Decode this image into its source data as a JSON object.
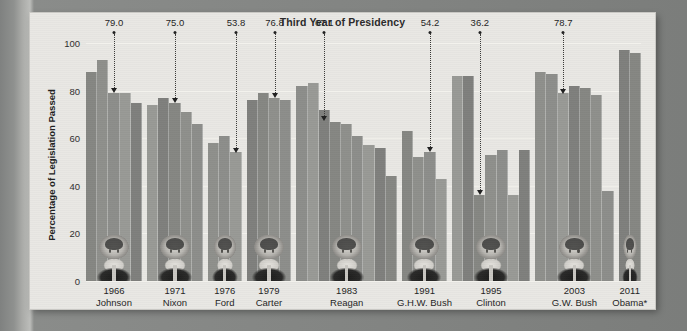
{
  "chart_title": "Third Year of Presidency",
  "y_axis_label": "Percentage of Legislation Passed",
  "y_ticks": [
    "0",
    "20",
    "40",
    "60",
    "80",
    "100"
  ],
  "watermark": "photocopy edge artifact",
  "chart_data": {
    "type": "bar",
    "title": "Third Year of Presidency",
    "xlabel": "",
    "ylabel": "Percentage of Legislation Passed",
    "ylim": [
      0,
      100
    ],
    "yticks": [
      0,
      20,
      40,
      60,
      80,
      100
    ],
    "grid": true,
    "legend": "none",
    "annotation_note": "Dotted callouts mark each president's third year in office",
    "groups": [
      {
        "president": "Johnson",
        "third_year": "1966",
        "third_year_value": 79.0,
        "callout_label": "79.0",
        "values": [
          88,
          93,
          79,
          79,
          75
        ]
      },
      {
        "president": "Nixon",
        "third_year": "1971",
        "third_year_value": 75.0,
        "callout_label": "75.0",
        "values": [
          74,
          77,
          75,
          71,
          66
        ]
      },
      {
        "president": "Ford",
        "third_year": "1976",
        "third_year_value": 53.8,
        "callout_label": "53.8",
        "values": [
          58,
          61,
          54
        ]
      },
      {
        "president": "Carter",
        "third_year": "1979",
        "third_year_value": 76.8,
        "callout_label": "76.8",
        "values": [
          76,
          79,
          77,
          76
        ]
      },
      {
        "president": "Reagan",
        "third_year": "1983",
        "third_year_value": 67.1,
        "callout_label": "67.1",
        "values": [
          82,
          83,
          72,
          67,
          66,
          61,
          57,
          56,
          44
        ]
      },
      {
        "president": "G.H.W. Bush",
        "third_year": "1991",
        "third_year_value": 54.2,
        "callout_label": "54.2",
        "values": [
          63,
          52,
          54,
          43
        ]
      },
      {
        "president": "Clinton",
        "third_year": "1995",
        "third_year_value": 36.2,
        "callout_label": "36.2",
        "values": [
          86,
          86,
          36,
          53,
          55,
          36,
          55
        ]
      },
      {
        "president": "G.W. Bush",
        "third_year": "2003",
        "third_year_value": 78.7,
        "callout_label": "78.7",
        "values": [
          88,
          87,
          79,
          82,
          81,
          78,
          38
        ]
      },
      {
        "president": "Obama*",
        "third_year": "2011",
        "third_year_value": null,
        "callout_label": "",
        "values": [
          97,
          96
        ]
      }
    ]
  }
}
